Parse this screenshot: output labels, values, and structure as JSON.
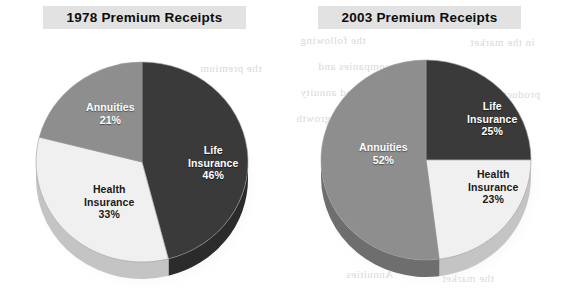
{
  "page": {
    "background_color": "#ffffff",
    "ghost_texts": [
      {
        "text": "the following",
        "x": 300,
        "y": 34
      },
      {
        "text": "in the market",
        "x": 470,
        "y": 36
      },
      {
        "text": "Insurance companies and",
        "x": 318,
        "y": 60
      },
      {
        "text": "the premium",
        "x": 200,
        "y": 62
      },
      {
        "text": "of life insurance and annuity",
        "x": 300,
        "y": 86
      },
      {
        "text": "products",
        "x": 498,
        "y": 88
      },
      {
        "text": "growth",
        "x": 296,
        "y": 112
      },
      {
        "text": "premiums",
        "x": 196,
        "y": 196
      },
      {
        "text": "the last",
        "x": 448,
        "y": 206
      },
      {
        "text": "Chapter 1",
        "x": 360,
        "y": 232
      },
      {
        "text": "nity and",
        "x": 430,
        "y": 238
      },
      {
        "text": "Annuities",
        "x": 346,
        "y": 268
      },
      {
        "text": "the market",
        "x": 442,
        "y": 272
      }
    ]
  },
  "charts": [
    {
      "id": "chart-1978",
      "title": "1978 Premium Receipts",
      "geometry": {
        "cx": 122,
        "cy": 118,
        "rx": 106,
        "ry": 100,
        "depth": 17
      },
      "slices": [
        {
          "name": "Life Insurance",
          "label_line1": "Life",
          "label_line2": "Insurance",
          "percent_label": "46%",
          "value": 46,
          "color": "#3a3a3a",
          "side_color": "#2b2b2b",
          "tone": "on-dark",
          "label_x": 168,
          "label_y": 100
        },
        {
          "name": "Health Insurance",
          "label_line1": "Health",
          "label_line2": "Insurance",
          "percent_label": "33%",
          "value": 33,
          "color": "#f0f0f0",
          "side_color": "#c4c4c4",
          "tone": "on-light",
          "label_x": 64,
          "label_y": 139
        },
        {
          "name": "Annuities",
          "label_line1": "Annuities",
          "label_line2": "",
          "percent_label": "21%",
          "value": 21,
          "color": "#8e8e8e",
          "side_color": "#6e6e6e",
          "tone": "on-mid",
          "label_x": 66,
          "label_y": 57
        }
      ]
    },
    {
      "id": "chart-2003",
      "title": "2003 Premium Receipts",
      "geometry": {
        "cx": 123,
        "cy": 116,
        "rx": 105,
        "ry": 100,
        "depth": 17
      },
      "slices": [
        {
          "name": "Life Insurance",
          "label_line1": "Life",
          "label_line2": "Insurance",
          "percent_label": "25%",
          "value": 25,
          "color": "#3a3a3a",
          "side_color": "#2b2b2b",
          "tone": "on-dark",
          "label_x": 164,
          "label_y": 56
        },
        {
          "name": "Health Insurance",
          "label_line1": "Health",
          "label_line2": "Insurance",
          "percent_label": "23%",
          "value": 23,
          "color": "#f0f0f0",
          "side_color": "#c4c4c4",
          "tone": "on-light",
          "label_x": 165,
          "label_y": 124
        },
        {
          "name": "Annuities",
          "label_line1": "Annuities",
          "label_line2": "",
          "percent_label": "52%",
          "value": 52,
          "color": "#8e8e8e",
          "side_color": "#6e6e6e",
          "tone": "on-mid",
          "label_x": 56,
          "label_y": 97
        }
      ]
    }
  ],
  "chart_data": [
    {
      "type": "pie",
      "title": "1978 Premium Receipts",
      "categories": [
        "Life Insurance",
        "Health Insurance",
        "Annuities"
      ],
      "values": [
        46,
        33,
        21
      ],
      "value_suffix": "%",
      "colors": [
        "#3a3a3a",
        "#f0f0f0",
        "#8e8e8e"
      ],
      "start_angle_deg": 0,
      "direction": "clockwise",
      "legend": "none",
      "labels_inside": true,
      "three_d": true
    },
    {
      "type": "pie",
      "title": "2003 Premium Receipts",
      "categories": [
        "Life Insurance",
        "Health Insurance",
        "Annuities"
      ],
      "values": [
        25,
        23,
        52
      ],
      "value_suffix": "%",
      "colors": [
        "#3a3a3a",
        "#f0f0f0",
        "#8e8e8e"
      ],
      "start_angle_deg": 0,
      "direction": "clockwise",
      "legend": "none",
      "labels_inside": true,
      "three_d": true
    }
  ]
}
